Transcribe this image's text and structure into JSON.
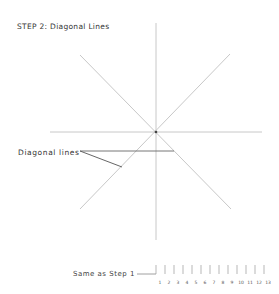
{
  "title": "STEP 2: Diagonal Lines",
  "annotation": "Diagonal lines",
  "footer_label": "Same as Step 1",
  "ruler": {
    "labels": [
      "1",
      "2",
      "3",
      "4",
      "5",
      "6",
      "7",
      "8",
      "9",
      "10",
      "11",
      "12",
      "13"
    ]
  },
  "colors": {
    "guide_line": "#c8c8c8",
    "leader_line": "#555555",
    "text": "#333333"
  }
}
